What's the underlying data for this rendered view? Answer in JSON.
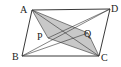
{
  "figure": {
    "type": "geometry-diagram",
    "colors": {
      "shade": "#c8c8c8",
      "line": "#222222"
    },
    "points": [
      {
        "id": "A",
        "label": "A"
      },
      {
        "id": "B",
        "label": "B"
      },
      {
        "id": "C",
        "label": "C"
      },
      {
        "id": "D",
        "label": "D"
      },
      {
        "id": "P",
        "label": "P"
      },
      {
        "id": "Q",
        "label": "Q"
      }
    ],
    "shaded_region": [
      "A",
      "P",
      "C",
      "Q"
    ],
    "segments": [
      [
        "A",
        "B"
      ],
      [
        "B",
        "C"
      ],
      [
        "C",
        "D"
      ],
      [
        "D",
        "A"
      ],
      [
        "A",
        "C"
      ],
      [
        "A",
        "P"
      ],
      [
        "P",
        "C"
      ],
      [
        "A",
        "Q"
      ],
      [
        "Q",
        "C"
      ],
      [
        "B",
        "Q"
      ],
      [
        "B",
        "D"
      ],
      [
        "D",
        "P"
      ]
    ]
  }
}
